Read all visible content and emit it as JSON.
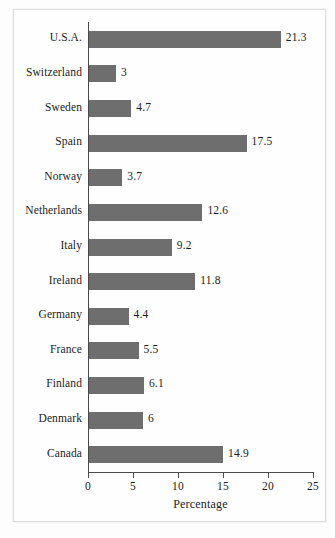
{
  "chart_data": {
    "type": "bar",
    "orientation": "horizontal",
    "title": "",
    "xlabel": "Percentage",
    "ylabel": "",
    "xlim": [
      0,
      25
    ],
    "xticks": [
      0,
      5,
      10,
      15,
      20,
      25
    ],
    "grid": false,
    "legend": null,
    "bar_color": "#6e6e6e",
    "categories": [
      "U.S.A.",
      "Switzerland",
      "Sweden",
      "Spain",
      "Norway",
      "Netherlands",
      "Italy",
      "Ireland",
      "Germany",
      "France",
      "Finland",
      "Denmark",
      "Canada"
    ],
    "values": [
      21.3,
      3,
      4.7,
      17.5,
      3.7,
      12.6,
      9.2,
      11.8,
      4.4,
      5.5,
      6.1,
      6,
      14.9
    ],
    "value_labels": [
      "21.3",
      "3",
      "4.7",
      "17.5",
      "3.7",
      "12.6",
      "9.2",
      "11.8",
      "4.4",
      "5.5",
      "6.1",
      "6",
      "14.9"
    ]
  }
}
